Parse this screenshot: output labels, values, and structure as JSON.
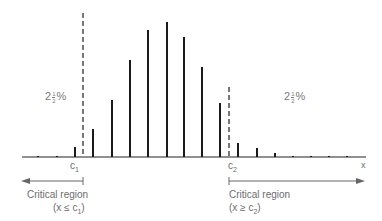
{
  "chart_data": {
    "type": "bar",
    "title": "",
    "xlabel": "x",
    "ylabel": "",
    "grid": false,
    "bar_positions_px": [
      38,
      57,
      75,
      93,
      112,
      130,
      148,
      167,
      184,
      202,
      220,
      238,
      257,
      275,
      293,
      311,
      329,
      347
    ],
    "bar_heights_px": [
      1,
      1,
      10,
      28,
      57,
      97,
      127,
      135,
      120,
      90,
      54,
      14,
      9,
      4,
      1,
      1,
      1,
      1
    ],
    "critical_values": [
      {
        "name": "c1",
        "label": "c",
        "subscript": "1",
        "x_px": 83
      },
      {
        "name": "c2",
        "label": "c",
        "subscript": "2",
        "x_px": 229
      }
    ],
    "tail_annotations": [
      {
        "side": "left",
        "whole": "2",
        "num": "1",
        "den": "2",
        "suffix": "%"
      },
      {
        "side": "right",
        "whole": "2",
        "num": "1",
        "den": "2",
        "suffix": "%"
      }
    ]
  },
  "labels": {
    "x_axis": "x",
    "c1": "c",
    "c1_sub": "1",
    "c2": "c",
    "c2_sub": "2",
    "left_pct_whole": "2",
    "left_pct_num": "1",
    "left_pct_den": "2",
    "left_pct_suffix": "%",
    "right_pct_whole": "2",
    "right_pct_num": "1",
    "right_pct_den": "2",
    "right_pct_suffix": "%",
    "left_region_title": "Critical region",
    "left_region_cond_pre": "(x ≤ c",
    "left_region_cond_sub": "1",
    "left_region_cond_post": ")",
    "right_region_title": "Critical region",
    "right_region_cond_pre": "(x ≥ c",
    "right_region_cond_sub": "2",
    "right_region_cond_post": ")"
  },
  "colors": {
    "bars": "#1a1a1a",
    "axis": "#222222",
    "dashed": "#777777",
    "text": "#6d6d6d",
    "arrow": "#666666"
  }
}
